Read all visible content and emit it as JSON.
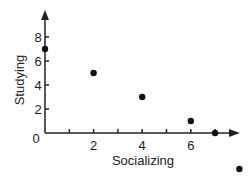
{
  "chart_data": {
    "type": "scatter",
    "title": "",
    "xlabel": "Socializing",
    "ylabel": "Studying",
    "x_ticks": [
      "2",
      "4",
      "6"
    ],
    "y_ticks": [
      "0",
      "2",
      "4",
      "6",
      "8"
    ],
    "xlim": [
      0,
      8
    ],
    "ylim": [
      0,
      9
    ],
    "grid": false,
    "points": [
      {
        "x": 0,
        "y": 7
      },
      {
        "x": 2,
        "y": 5
      },
      {
        "x": 4,
        "y": 3
      },
      {
        "x": 6,
        "y": 1
      },
      {
        "x": 7,
        "y": 0
      },
      {
        "x": 8,
        "y": -3
      }
    ],
    "colors": {
      "axis": "#222222",
      "point": "#111111"
    }
  }
}
